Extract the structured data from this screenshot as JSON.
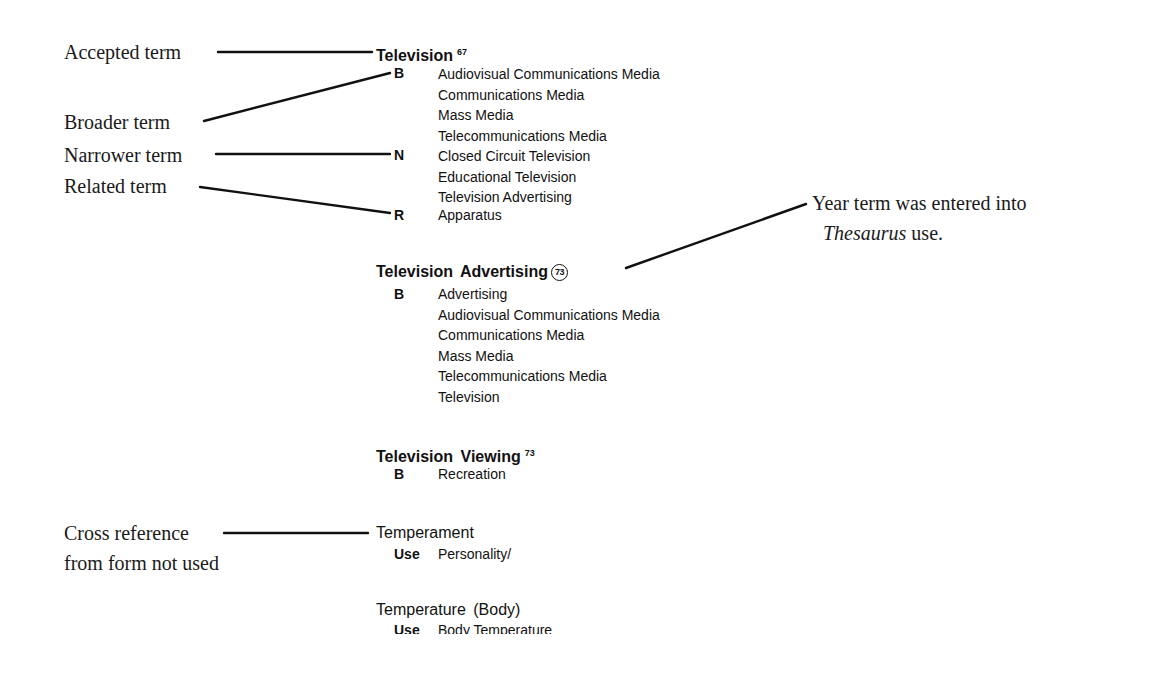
{
  "annotations": {
    "accepted_term": "Accepted term",
    "broader_term": "Broader term",
    "narrower_term": "Narrower term",
    "related_term": "Related term",
    "cross_reference_line1": "Cross reference",
    "cross_reference_line2": "from form not used",
    "year_note_line1": "Year term was entered into",
    "year_note_italic": "Thesaurus",
    "year_note_rest": " use."
  },
  "entries": [
    {
      "term": "Television",
      "year": "67",
      "broader_code": "B",
      "broader": [
        "Audiovisual Communications Media",
        "Communications Media",
        "Mass Media",
        "Telecommunications Media"
      ],
      "narrower_code": "N",
      "narrower": [
        "Closed Circuit Television",
        "Educational Television",
        "Television Advertising"
      ],
      "related_code": "R",
      "related": [
        "Apparatus"
      ]
    },
    {
      "term": "Television Advertising",
      "year": "73",
      "broader_code": "B",
      "broader": [
        "Advertising",
        "Audiovisual Communications Media",
        "Communications Media",
        "Mass Media",
        "Telecommunications Media",
        "Television"
      ]
    },
    {
      "term": "Television Viewing",
      "year": "73",
      "broader_code": "B",
      "broader": [
        "Recreation"
      ]
    },
    {
      "term": "Temperament",
      "use_code": "Use",
      "use": "Personality/"
    },
    {
      "term": "Temperature (Body)",
      "use_code": "Use",
      "use": "Body Temperature"
    }
  ]
}
